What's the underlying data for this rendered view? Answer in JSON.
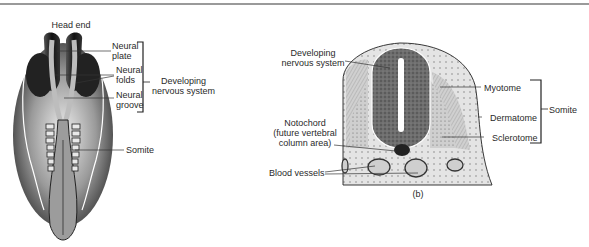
{
  "figure_a": {
    "title": "Head end",
    "labels": {
      "neural_plate": [
        "Neural",
        "plate"
      ],
      "neural_folds": [
        "Neural",
        "folds"
      ],
      "neural_groove": [
        "Neural",
        "groove"
      ],
      "developing_nervous_system": [
        "Developing",
        "nervous system"
      ],
      "somite": "Somite"
    }
  },
  "figure_b": {
    "caption": "(b)",
    "labels": {
      "developing_nervous_system": [
        "Developing",
        "nervous system"
      ],
      "notochord": [
        "Notochord",
        "(future vertebral",
        "column area)"
      ],
      "blood_vessels": "Blood vessels",
      "myotome": "Myotome",
      "dermatome": "Dermatome",
      "sclerotome": "Sclerotome",
      "somite": "Somite"
    }
  },
  "colors": {
    "rule": "#9a9a9a",
    "embryo_dark": "#1e1e1e",
    "embryo_mid": "#7a7a7a",
    "embryo_light": "#d8d8d8",
    "neural_tube": "#6a6a6a",
    "somite_fill": "#c4c4c4",
    "mesenchyme": "#e2e2e2"
  }
}
